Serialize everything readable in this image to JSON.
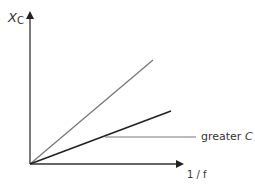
{
  "diagram": {
    "y_axis_label": "X",
    "y_axis_label_sub": "C",
    "x_axis_label": "1 / f",
    "annotation_text": "greater",
    "annotation_var": "C",
    "lines": [
      {
        "name": "smaller-C",
        "from": [
          30,
          164
        ],
        "to": [
          153,
          60
        ],
        "color": "#777777"
      },
      {
        "name": "greater-C",
        "from": [
          30,
          164
        ],
        "to": [
          171,
          111
        ],
        "color": "#222222"
      }
    ]
  }
}
